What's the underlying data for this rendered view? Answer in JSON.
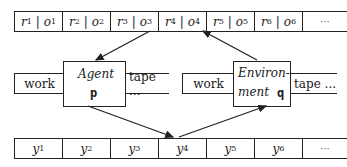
{
  "top_tape": {
    "cells": [
      {
        "r": "r",
        "ri": "1",
        "o": "o",
        "oi": "1"
      },
      {
        "r": "r",
        "ri": "2",
        "o": "o",
        "oi": "2"
      },
      {
        "r": "r",
        "ri": "3",
        "o": "o",
        "oi": "3"
      },
      {
        "r": "r",
        "ri": "4",
        "o": "o",
        "oi": "4"
      },
      {
        "r": "r",
        "ri": "5",
        "o": "o",
        "oi": "5"
      },
      {
        "r": "r",
        "ri": "6",
        "o": "o",
        "oi": "6"
      }
    ],
    "separator": "|",
    "ellipsis": "···"
  },
  "bottom_tape": {
    "cells": [
      {
        "y": "y",
        "i": "1"
      },
      {
        "y": "y",
        "i": "2"
      },
      {
        "y": "y",
        "i": "3"
      },
      {
        "y": "y",
        "i": "4"
      },
      {
        "y": "y",
        "i": "5"
      },
      {
        "y": "y",
        "i": "6"
      }
    ],
    "ellipsis": "···"
  },
  "agent": {
    "title": "Agent",
    "symbol": "p",
    "work_label": "work",
    "tape_label": "tape ..."
  },
  "environment": {
    "title_line1": "Environ-",
    "title_line2": "ment",
    "symbol": "q",
    "work_label": "work",
    "tape_label": "tape ..."
  }
}
